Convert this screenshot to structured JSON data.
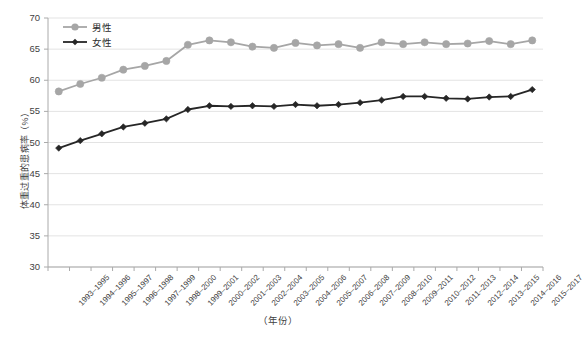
{
  "chart_data": {
    "type": "line",
    "title": "",
    "xlabel": "（年份）",
    "ylabel": "体重过重的患病率（%）",
    "ylim": [
      30,
      70
    ],
    "ytick_step": 5,
    "yticks": [
      "70",
      "65",
      "60",
      "55",
      "50",
      "45",
      "40",
      "35",
      "30"
    ],
    "grid": true,
    "legend_position": "top-left",
    "categories": [
      "1993–1995",
      "1994–1996",
      "1995–1997",
      "1996–1998",
      "1997–1999",
      "1998–2000",
      "1999–2001",
      "2000–2002",
      "2001–2003",
      "2002–2004",
      "2003–2005",
      "2004–2006",
      "2005–2007",
      "2006–2008",
      "2007–2009",
      "2008–2010",
      "2009–2011",
      "2010–2012",
      "2011–2013",
      "2012–2014",
      "2013–2015",
      "2014–2016",
      "2015–2017"
    ],
    "series": [
      {
        "name": "男性",
        "color": "#a6a6a6",
        "marker": "circle",
        "values": [
          58.2,
          59.4,
          60.4,
          61.7,
          62.3,
          63.1,
          65.7,
          66.4,
          66.1,
          65.4,
          65.2,
          66.0,
          65.6,
          65.8,
          65.2,
          66.1,
          65.8,
          66.1,
          65.8,
          65.9,
          66.3,
          65.8,
          66.4
        ]
      },
      {
        "name": "女性",
        "color": "#262626",
        "marker": "diamond",
        "values": [
          49.1,
          50.3,
          51.4,
          52.5,
          53.1,
          53.8,
          55.3,
          55.9,
          55.8,
          55.9,
          55.8,
          56.1,
          55.9,
          56.1,
          56.4,
          56.8,
          57.4,
          57.4,
          57.1,
          57.0,
          57.3,
          57.4,
          58.5
        ]
      }
    ]
  },
  "legend": {
    "items": [
      {
        "label": "男性"
      },
      {
        "label": "女性"
      }
    ]
  },
  "colors": {
    "male": "#a6a6a6",
    "female": "#262626",
    "grid": "#e3e3e3",
    "axis": "#aaaaaa",
    "text": "#3f3f3f"
  }
}
